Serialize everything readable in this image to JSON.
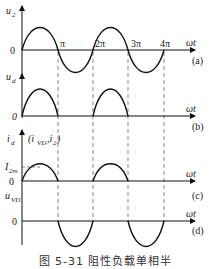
{
  "figure": {
    "caption": "图 5-31   阻性负载单相半",
    "x_axis_label": "ωt",
    "tick_labels": [
      "π",
      "2π",
      "3π",
      "4π"
    ],
    "panels": [
      {
        "id": "a",
        "tag": "(a)",
        "y_label": "u",
        "y_sub": "2",
        "zero": "0"
      },
      {
        "id": "b",
        "tag": "(b)",
        "y_label": "u",
        "y_sub": "d",
        "zero": "0"
      },
      {
        "id": "c",
        "tag": "(c)",
        "y_label": "i",
        "y_sub": "d",
        "y_extra": "(i",
        "y_extra_sub": "VD",
        "y_extra_tail": ",i",
        "y_extra_sub2": "2",
        "y_extra_close": ")",
        "peak_label": "I",
        "peak_sub": "2m",
        "zero": "0"
      },
      {
        "id": "d",
        "tag": "(d)",
        "y_label": "u",
        "y_sub": "VD",
        "zero": "0"
      }
    ]
  },
  "colors": {
    "stroke": "#111111",
    "dash": "#555555"
  }
}
